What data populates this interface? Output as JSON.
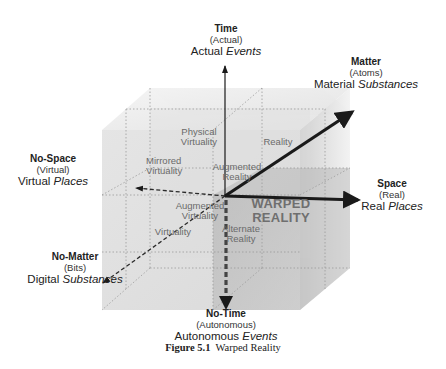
{
  "figure": {
    "caption_number": "Figure 5.1",
    "caption_title": "Warped Reality"
  },
  "axes": {
    "time": {
      "title": "Time",
      "subtitle": "(Actual)",
      "desc_plain": "Actual",
      "desc_italic": "Events",
      "arrow_style": "solid-thin",
      "direction": "up"
    },
    "no_time": {
      "title": "No-Time",
      "subtitle": "(Autonomous)",
      "desc_plain": "Autonomous",
      "desc_italic": "Events",
      "arrow_style": "dashed-thick",
      "direction": "down"
    },
    "matter": {
      "title": "Matter",
      "subtitle": "(Atoms)",
      "desc_plain": "Material",
      "desc_italic": "Substances",
      "arrow_style": "solid-thick",
      "direction": "up-right"
    },
    "no_matter": {
      "title": "No-Matter",
      "subtitle": "(Bits)",
      "desc_plain": "Digital",
      "desc_italic": "Substances",
      "arrow_style": "dashed",
      "direction": "down-left"
    },
    "space": {
      "title": "Space",
      "subtitle": "(Real)",
      "desc_plain": "Real",
      "desc_italic": "Places",
      "arrow_style": "solid-thick",
      "direction": "right"
    },
    "no_space": {
      "title": "No-Space",
      "subtitle": "(Virtual)",
      "desc_plain": "Virtual",
      "desc_italic": "Places",
      "arrow_style": "dashed",
      "direction": "left"
    }
  },
  "cells": {
    "physical_virtuality": [
      "Physical",
      "Virtuality"
    ],
    "reality": "Reality",
    "mirrored_virtuality": [
      "Mirrored",
      "Virtuality"
    ],
    "augmented_reality": [
      "Augmented",
      "Reality"
    ],
    "augmented_virtuality": [
      "Augmented",
      "Virtuality"
    ],
    "virtuality": "Virtuality",
    "alternate_reality": [
      "Alternate",
      "Reality"
    ],
    "warped_reality": [
      "WARPED",
      "REALITY"
    ]
  },
  "colors": {
    "axis": "#1a1a1a",
    "cube_light": "#e6e6e6",
    "cube_mid": "#d2d2d2",
    "highlight_octant": "#bdbdbd",
    "cell_text": "#6a6a6a"
  }
}
